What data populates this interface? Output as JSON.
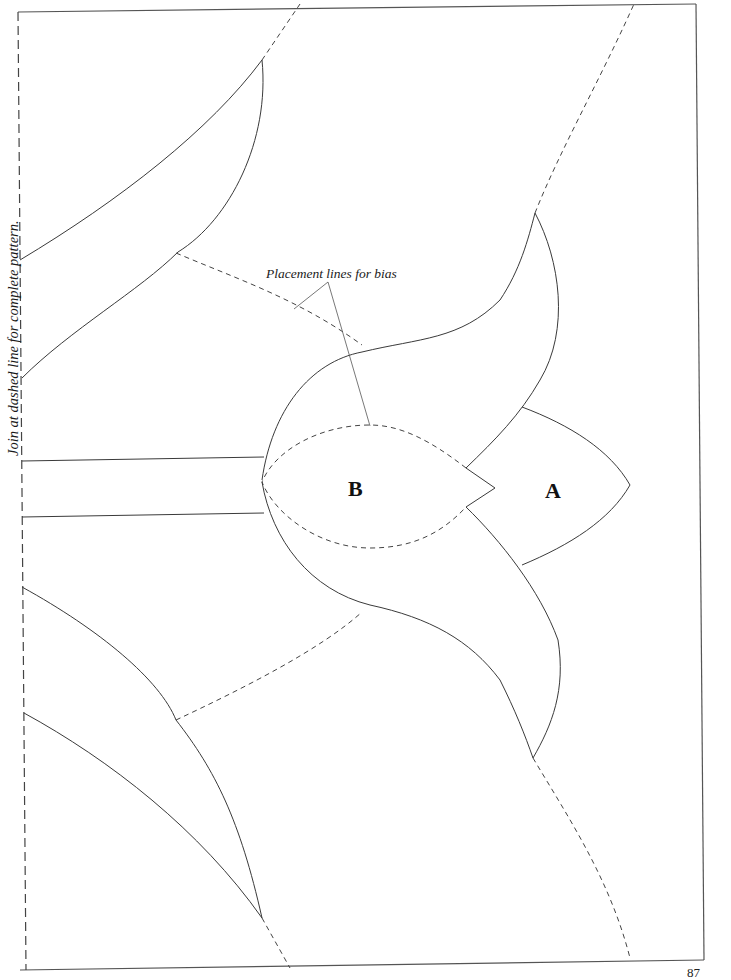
{
  "page": {
    "side_note": "Join at dashed line for complete pattern.",
    "callout": "Placement lines for bias",
    "page_number": "87"
  },
  "pieces": [
    {
      "id": "A",
      "label": "A"
    },
    {
      "id": "B",
      "label": "B"
    }
  ],
  "colors": {
    "line": "#3a3a3a",
    "background": "#ffffff"
  }
}
